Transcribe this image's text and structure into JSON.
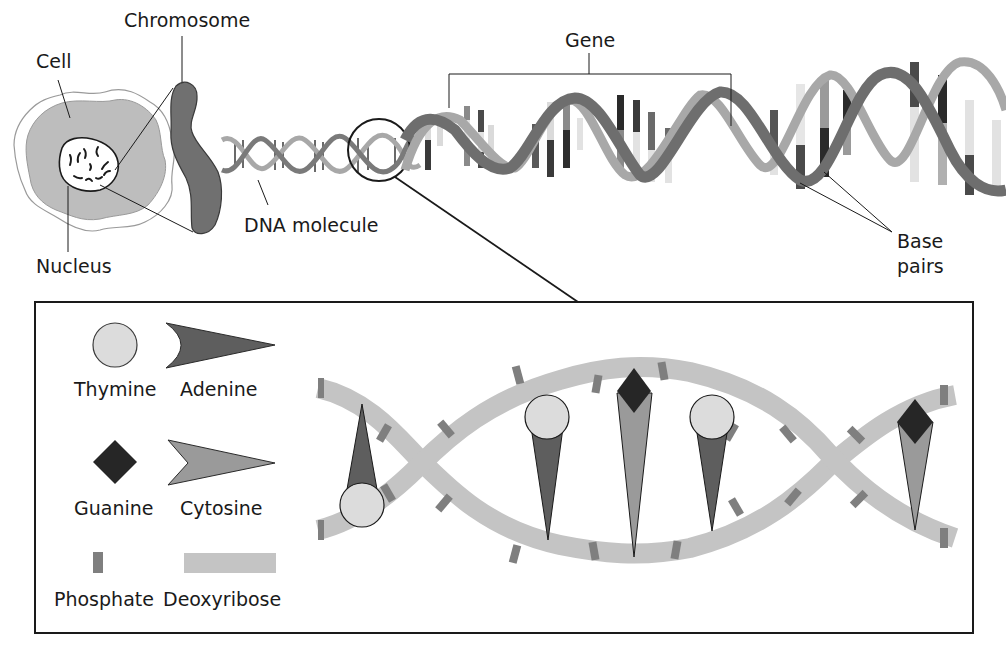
{
  "diagram": {
    "type": "biology-illustration"
  },
  "overview": {
    "labels": {
      "cell": "Cell",
      "chromosome": "Chromosome",
      "nucleus": "Nucleus",
      "dna_molecule": "DNA molecule",
      "gene": "Gene",
      "base_pairs_line1": "Base",
      "base_pairs_line2": "pairs"
    }
  },
  "detail": {
    "legend": [
      {
        "key": "thymine",
        "label": "Thymine",
        "shape": "circle",
        "color": "#dcdcdc"
      },
      {
        "key": "adenine",
        "label": "Adenine",
        "shape": "concave-wedge",
        "color": "#5e5e5e"
      },
      {
        "key": "guanine",
        "label": "Guanine",
        "shape": "diamond",
        "color": "#262626"
      },
      {
        "key": "cytosine",
        "label": "Cytosine",
        "shape": "notched-wedge",
        "color": "#9a9a9a"
      },
      {
        "key": "phosphate",
        "label": "Phosphate",
        "shape": "small-bar",
        "color": "#7f7f7f"
      },
      {
        "key": "deoxyribose",
        "label": "Deoxyribose",
        "shape": "wide-band",
        "color": "#c4c4c4"
      }
    ],
    "base_pairs_shown": [
      {
        "top": "adenine",
        "bottom": "thymine"
      },
      {
        "top": "thymine",
        "bottom": "adenine"
      },
      {
        "top": "guanine",
        "bottom": "cytosine"
      },
      {
        "top": "thymine",
        "bottom": "adenine"
      },
      {
        "top": "guanine",
        "bottom": "cytosine"
      }
    ]
  },
  "colors": {
    "outline": "#1a1a1a",
    "strand_dark": "#6e6e6e",
    "strand_light": "#a8a8a8",
    "cytoplasm": "#bdbdbd",
    "chromosome": "#707070"
  }
}
